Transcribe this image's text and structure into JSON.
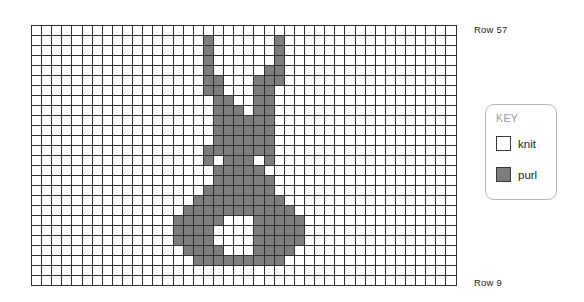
{
  "chart_data": {
    "type": "heatmap",
    "title": "",
    "xlabel": "",
    "ylabel": "",
    "columns": 42,
    "rows": 26,
    "cell_values": [
      "knit",
      "purl"
    ],
    "row_range_labels": {
      "top": "Row 57",
      "bottom": "Row 9"
    },
    "row_numbers_top_to_bottom": [
      57,
      55,
      53,
      51,
      49,
      47,
      45,
      43,
      41,
      39,
      37,
      35,
      33,
      31,
      29,
      27,
      25,
      23,
      21,
      19,
      17,
      15,
      13,
      11,
      9,
      7
    ],
    "legend": {
      "title": "KEY",
      "entries": [
        {
          "label": "knit",
          "color": "#ffffff"
        },
        {
          "label": "purl",
          "color": "#7d7d7d"
        }
      ]
    },
    "colors": {
      "knit": "#ffffff",
      "purl": "#7d7d7d",
      "gridline": "#2e2e2e",
      "key_border": "#b9b9b9",
      "key_title": "#9a9a9a",
      "text": "#231f20"
    },
    "purl_cells_by_row": [
      [],
      [
        17,
        24
      ],
      [
        17,
        24
      ],
      [
        17,
        24
      ],
      [
        17,
        23,
        24
      ],
      [
        17,
        18,
        22,
        23,
        24
      ],
      [
        17,
        18,
        22,
        23
      ],
      [
        18,
        19,
        22,
        23
      ],
      [
        18,
        19,
        20,
        22,
        23
      ],
      [
        18,
        19,
        20,
        21,
        22,
        23
      ],
      [
        18,
        19,
        20,
        21,
        22,
        23
      ],
      [
        18,
        19,
        20,
        21,
        22,
        23
      ],
      [
        17,
        18,
        19,
        20,
        21,
        22,
        23
      ],
      [
        17,
        19,
        20,
        21,
        23
      ],
      [
        18,
        19,
        20,
        21,
        22
      ],
      [
        18,
        19,
        20,
        21,
        22,
        23
      ],
      [
        17,
        18,
        19,
        20,
        21,
        22,
        23
      ],
      [
        16,
        17,
        18,
        19,
        20,
        21,
        22,
        23,
        24
      ],
      [
        15,
        16,
        17,
        18,
        19,
        20,
        21,
        22,
        23,
        24,
        25
      ],
      [
        14,
        15,
        16,
        17,
        18,
        22,
        23,
        24,
        25,
        26
      ],
      [
        14,
        15,
        16,
        17,
        22,
        23,
        24,
        25,
        26
      ],
      [
        14,
        15,
        16,
        17,
        22,
        23,
        24,
        25,
        26
      ],
      [
        15,
        16,
        17,
        18,
        22,
        23,
        24,
        25
      ],
      [
        16,
        17,
        18,
        19,
        20,
        21,
        22,
        23,
        24
      ],
      [],
      []
    ]
  },
  "row_labels": {
    "top": "Row 57",
    "bottom": "Row 9"
  },
  "key": {
    "title": "KEY",
    "knit_label": "knit",
    "purl_label": "purl"
  }
}
